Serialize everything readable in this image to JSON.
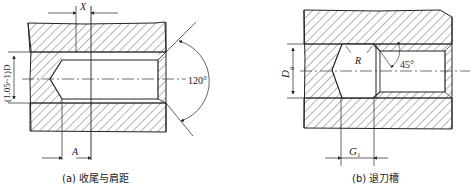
{
  "figure_a": {
    "caption": "(a)  收尾与肩距",
    "dim_x": "X",
    "dim_a": "A",
    "dim_d": "(1.05~1)D",
    "angle": "120°"
  },
  "figure_b": {
    "caption": "(b)  退刀槽",
    "dim_dg_main": "D",
    "dim_dg_sub": "g",
    "dim_r": "R",
    "dim_g1_main": "G",
    "dim_g1_sub": "1",
    "angle": "45°"
  },
  "colors": {
    "line": "#222222",
    "hatch": "#444444",
    "background": "#ffffff"
  }
}
